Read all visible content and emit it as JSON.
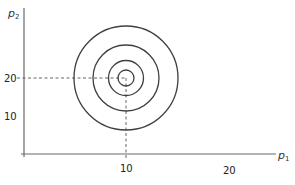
{
  "diagram": {
    "type": "indifference-curves-concentric",
    "x_axis": {
      "label": "p",
      "subscript": "1",
      "ticks": [
        "10",
        "20"
      ]
    },
    "y_axis": {
      "label": "p",
      "subscript": "2",
      "ticks": [
        "20",
        "10"
      ]
    },
    "bliss_point": {
      "x": 10,
      "y": 20
    },
    "rings": 4,
    "colors": {
      "axis": "#6a6a6a",
      "ring": "#3f3f3f",
      "guide": "#555555"
    }
  }
}
